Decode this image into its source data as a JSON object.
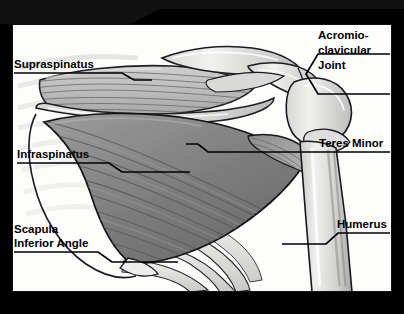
{
  "figure": {
    "orientation_header": "POSTERIOR",
    "region": "shoulder",
    "frame_color": "#111111",
    "panel_color": "#fdfdfc"
  },
  "labels": {
    "supraspinatus": "Supraspinatus",
    "infraspinatus": "Infraspinatus",
    "scapula_inferior_angle_line1": "Scapula",
    "scapula_inferior_angle_line2": "Inferior Angle",
    "acromioclavicular_line1": "Acromio-",
    "acromioclavicular_line2": "clavicular",
    "acromioclavicular_line3": "Joint",
    "teres_minor": "Teres Minor",
    "humerus": "Humerus"
  },
  "anatomy_colors": {
    "muscle_light": "#b9b9b9",
    "muscle_dark": "#7e7e7e",
    "bone_light": "#e3e3e1",
    "bone_mid": "#c4c4c2",
    "outline": "#1a1a1a"
  }
}
